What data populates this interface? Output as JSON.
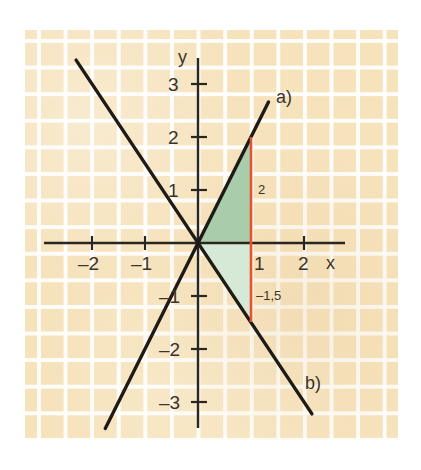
{
  "figure": {
    "kind": "coordinate-grid-plot",
    "background_color": "#ffffff",
    "paper_color": "#f6e2bb",
    "grid_line_color": "#ffffff",
    "axis_color": "#2b2520",
    "line_color": "#1e1a16",
    "highlight_color": "#e8532b"
  },
  "axes": {
    "x_label": "x",
    "y_label": "y",
    "x_ticks": [
      {
        "value": -2,
        "label": "–2"
      },
      {
        "value": -1,
        "label": "–1"
      },
      {
        "value": 1,
        "label": "1"
      },
      {
        "value": 2,
        "label": "2"
      }
    ],
    "y_ticks": [
      {
        "value": 3,
        "label": "3"
      },
      {
        "value": 2,
        "label": "2"
      },
      {
        "value": 1,
        "label": "1"
      },
      {
        "value": -1,
        "label": "–1"
      },
      {
        "value": -2,
        "label": "–2"
      },
      {
        "value": -3,
        "label": "–3"
      }
    ],
    "xlim": [
      -2.9,
      3.3
    ],
    "ylim": [
      -3.6,
      3.6
    ],
    "unit_px": 53
  },
  "curves": [
    {
      "id": "a",
      "label": "a)",
      "description": "rising straight line through origin, slope 2",
      "slope": 2,
      "intercept": 0,
      "x_from": -1.75,
      "x_to": 1.33
    },
    {
      "id": "b",
      "label": "b)",
      "description": "falling straight line through origin, slope -1.5",
      "slope": -1.5,
      "intercept": 0,
      "x_from": -2.3,
      "x_to": 2.15
    }
  ],
  "highlight_segment": {
    "name": "vertical segment at x = 1",
    "x": 1,
    "y_top": 2,
    "y_bottom": -1.5,
    "color": "#e8532b",
    "top_label": "2",
    "bottom_label": "–1,5",
    "x_axis_label": "1"
  },
  "shaded_regions": [
    {
      "name": "upper-triangle",
      "color": "#a9cdab",
      "vertices": [
        [
          0,
          0
        ],
        [
          1,
          2
        ],
        [
          1,
          0
        ]
      ]
    },
    {
      "name": "lower-triangle",
      "color": "#d6e9d7",
      "vertices": [
        [
          0,
          0
        ],
        [
          1,
          0
        ],
        [
          1,
          -1.5
        ]
      ]
    }
  ]
}
